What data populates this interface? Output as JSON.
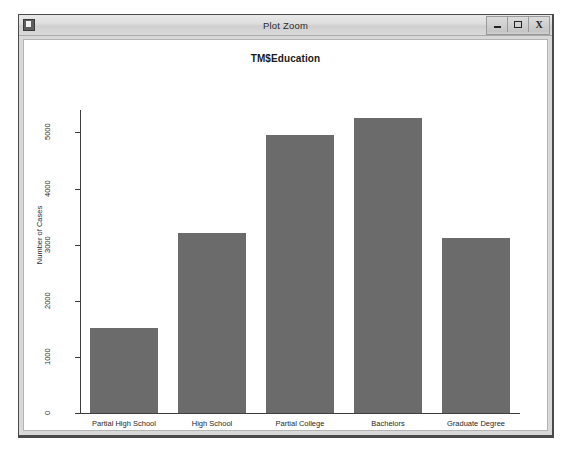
{
  "window": {
    "title": "Plot Zoom",
    "icon": "app-icon",
    "controls": [
      {
        "name": "minimize",
        "glyph": "–"
      },
      {
        "name": "maximize",
        "glyph": "□"
      },
      {
        "name": "close",
        "glyph": "X"
      }
    ]
  },
  "chart_data": {
    "type": "bar",
    "title": "TM$Education",
    "xlabel": "TM$Education",
    "ylabel": "Number of Cases",
    "categories": [
      "Partial High School",
      "High School",
      "Partial College",
      "Bachelors",
      "Graduate Degree"
    ],
    "values": [
      1520,
      3200,
      4960,
      5260,
      3120
    ],
    "ylim": [
      0,
      5400
    ],
    "yticks": [
      0,
      1000,
      2000,
      3000,
      4000,
      5000
    ],
    "ytick_labels": [
      "0",
      "1000",
      "2000",
      "3000",
      "4000",
      "5000"
    ],
    "grid": false,
    "legend": null,
    "bar_color": "#6b6b6b",
    "axis_color": "#3c3c3c",
    "background": "#ffffff"
  }
}
